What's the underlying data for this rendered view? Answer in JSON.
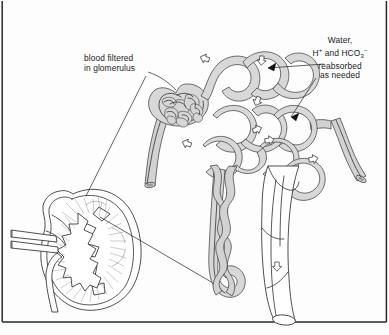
{
  "figure": {
    "kind": "anatomical-illustration",
    "frame": {
      "left_border": true,
      "right_border": true,
      "bottom_border": true,
      "top_border": false,
      "border_color": "#2a2a2a"
    },
    "palette": {
      "background": "#fdfdfd",
      "ink": "#1b1b1b",
      "outline": "#3a3a3a",
      "tubule_fill": "#d8d8d8",
      "vessel_fill": "#d2d2d2",
      "organ_fill": "#ffffff",
      "hatch": "#8a8a8a",
      "leader_line": "#222222"
    }
  },
  "labels": {
    "glomerulus": {
      "line1": "blood filtered",
      "line2": "in glomerulus",
      "pointer": "leader-line-to-glomerulus"
    },
    "reabsorption": {
      "line1": "Water,",
      "line2_pre": "H",
      "line2_sup": "+",
      "line2_mid": " and HCO",
      "line2_sub": "3",
      "line2_sup2": "−",
      "line3": "reabsorbed",
      "line4": "as needed",
      "pointers": 2
    }
  },
  "structures": {
    "kidney": "kidney-cross-section",
    "glomerulus": "glomerular-capillary-tuft",
    "bowmans_capsule": "bowmans-capsule",
    "proximal_tubule": "proximal-convoluted-tubule",
    "distal_tubule": "distal-convoluted-tubule",
    "loop_of_henle": "loop-of-henle",
    "collecting_duct": "collecting-duct",
    "afferent_vessel": "afferent-arteriole",
    "efferent_vessel": "efferent-arteriole",
    "peritubular_capillaries": "peritubular-capillary-network",
    "ureter": "ureter",
    "flow_arrows": 8
  }
}
